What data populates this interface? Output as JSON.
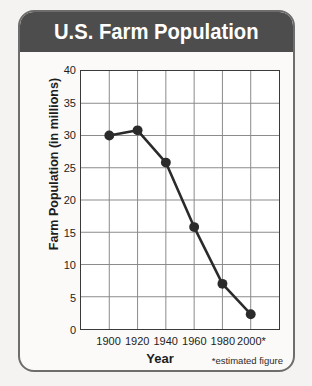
{
  "card": {
    "title": "U.S. Farm Population"
  },
  "chart_data": {
    "type": "line",
    "title": "U.S. Farm Population",
    "xlabel": "Year",
    "ylabel": "Farm Population (in millions)",
    "footnote": "*estimated figure",
    "x": [
      1900,
      1920,
      1940,
      1960,
      1980,
      2000
    ],
    "x_tick_labels": [
      "1900",
      "1920",
      "1940",
      "1960",
      "1980",
      "2000*"
    ],
    "values": [
      30.0,
      30.8,
      25.8,
      15.8,
      7.0,
      2.3
    ],
    "y_tick_labels": [
      "40",
      "35",
      "30",
      "25",
      "20",
      "15",
      "10",
      "5",
      "0"
    ],
    "y_ticks": [
      40,
      35,
      30,
      25,
      20,
      15,
      10,
      5,
      0
    ],
    "ylim": [
      0,
      40
    ],
    "xlim": [
      1890,
      2010
    ],
    "grid": true,
    "legend": "none",
    "series_color": "#2b2b2b",
    "marker": "circle",
    "marker_color": "#2b2b2b",
    "grid_color": "#8a8a8a",
    "frame_color": "#3a3a3a",
    "title_bar_color": "#4d4d4d",
    "title_text_color": "#ffffff",
    "plot_background": "#ffffff",
    "page_background": "#f4f3f1"
  }
}
